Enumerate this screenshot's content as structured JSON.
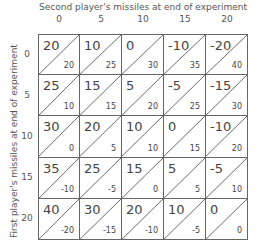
{
  "chart_data": {
    "type": "table",
    "title": "",
    "xlabel": "Second player's missiles at end of experiment",
    "ylabel": "First player's missiles at end of experiment",
    "columns": [
      "0",
      "5",
      "10",
      "15",
      "20"
    ],
    "rows": [
      "0",
      "5",
      "10",
      "15",
      "20"
    ],
    "cells": [
      [
        {
          "first": "20",
          "second": "20"
        },
        {
          "first": "10",
          "second": "25"
        },
        {
          "first": "0",
          "second": "30"
        },
        {
          "first": "-10",
          "second": "35"
        },
        {
          "first": "-20",
          "second": "40"
        }
      ],
      [
        {
          "first": "25",
          "second": "10"
        },
        {
          "first": "15",
          "second": "15"
        },
        {
          "first": "5",
          "second": "20"
        },
        {
          "first": "-5",
          "second": "25"
        },
        {
          "first": "-15",
          "second": "30"
        }
      ],
      [
        {
          "first": "30",
          "second": "0"
        },
        {
          "first": "20",
          "second": "5"
        },
        {
          "first": "10",
          "second": "10"
        },
        {
          "first": "0",
          "second": "15"
        },
        {
          "first": "-10",
          "second": "20"
        }
      ],
      [
        {
          "first": "35",
          "second": "-10"
        },
        {
          "first": "25",
          "second": "-5"
        },
        {
          "first": "15",
          "second": "0"
        },
        {
          "first": "5",
          "second": "5"
        },
        {
          "first": "-5",
          "second": "10"
        }
      ],
      [
        {
          "first": "40",
          "second": "-20"
        },
        {
          "first": "30",
          "second": "-15"
        },
        {
          "first": "20",
          "second": "-10"
        },
        {
          "first": "10",
          "second": "-5"
        },
        {
          "first": "0",
          "second": "0"
        }
      ]
    ]
  }
}
